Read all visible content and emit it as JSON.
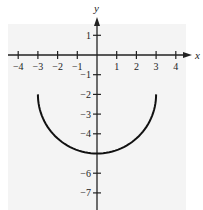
{
  "chart_data": {
    "type": "line",
    "title": "",
    "xlabel": "x",
    "ylabel": "y",
    "xlim": [
      -4.5,
      4.5
    ],
    "ylim": [
      -7.5,
      1.5
    ],
    "grid": false,
    "legend": null,
    "x_ticks": [
      -4,
      -3,
      -2,
      -1,
      1,
      2,
      3,
      4
    ],
    "x_tick_labels": [
      "−4",
      "−3",
      "−2",
      "−1",
      "1",
      "2",
      "3",
      "4"
    ],
    "y_ticks": [
      1,
      -1,
      -2,
      -3,
      -4,
      -6,
      -7
    ],
    "y_tick_labels": [
      "1",
      "−1",
      "−2",
      "−3",
      "−4",
      "−6",
      "−7"
    ],
    "series": [
      {
        "name": "lower semicircle",
        "description": "y = -2 - sqrt(9 - x^2), center (0,-2), radius 3",
        "x": [
          -3,
          -2.5,
          -2,
          -1,
          0,
          1,
          2,
          2.5,
          3
        ],
        "y": [
          -2,
          -3.66,
          -4.24,
          -4.83,
          -5,
          -4.83,
          -4.24,
          -3.66,
          -2
        ]
      }
    ],
    "colors": {
      "curve": "#111111",
      "axes": "#222222",
      "background": "#f4f4f4"
    }
  },
  "axes": {
    "x_label": "x",
    "y_label": "y"
  }
}
